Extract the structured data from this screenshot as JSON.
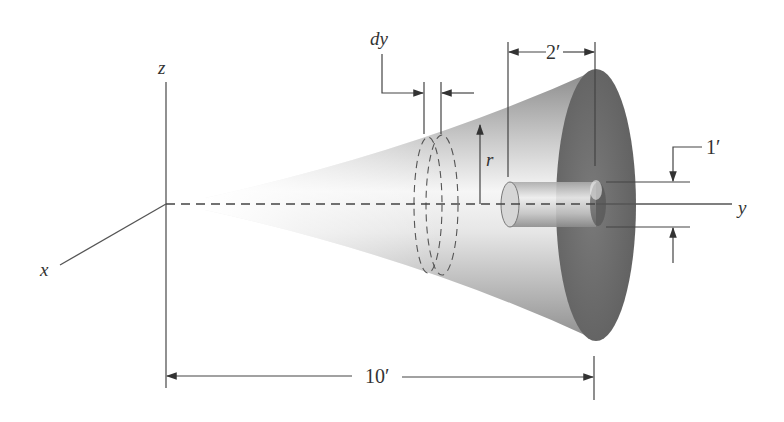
{
  "figure": {
    "axes": {
      "x_label": "x",
      "y_label": "y",
      "z_label": "z"
    },
    "element": {
      "thickness_label": "dy",
      "radius_label": "r"
    },
    "dimensions": {
      "total_length": "10′",
      "hole_length": "2′",
      "hole_diameter": "1′"
    },
    "colors": {
      "background": "#ffffff",
      "line": "#444444",
      "disk_face": "#6e6e6e",
      "cone_light": "#f2f2f2",
      "cone_dark": "#9a9a9a"
    }
  }
}
